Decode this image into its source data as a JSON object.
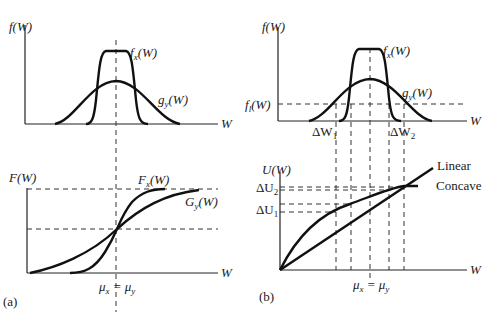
{
  "figure": {
    "panel_a": {
      "label": "(a)",
      "top": {
        "ylabel": "f(W)",
        "xlabel": "W",
        "curves": [
          {
            "name": "f_x(W)",
            "label": "f",
            "sub": "x",
            "suffix": "(W)",
            "shape": "narrow-tall"
          },
          {
            "name": "g_y(W)",
            "label": "g",
            "sub": "y",
            "suffix": "(W)",
            "shape": "wide-short"
          }
        ]
      },
      "bottom": {
        "ylabel": "F(W)",
        "xlabel": "W",
        "curves": [
          {
            "name": "F_x(W)",
            "label": "F",
            "sub": "x",
            "suffix": "(W)"
          },
          {
            "name": "G_y(W)",
            "label": "G",
            "sub": "y",
            "suffix": "(W)"
          }
        ],
        "mean_label": {
          "left": "μ",
          "left_sub": "x",
          "eq": " = ",
          "right": "μ",
          "right_sub": "y"
        }
      }
    },
    "panel_b": {
      "label": "(b)",
      "top": {
        "ylabel": "f(W)",
        "xlabel": "W",
        "threshold_label": {
          "main": "f",
          "sub": "l",
          "suffix": "(W)"
        },
        "curves": [
          {
            "name": "f_x(W)",
            "label": "f",
            "sub": "x",
            "suffix": "(W)"
          },
          {
            "name": "g_y(W)",
            "label": "g",
            "sub": "y",
            "suffix": "(W)"
          }
        ],
        "interval_labels": [
          {
            "main": "ΔW",
            "sub": "1"
          },
          {
            "main": "ΔW",
            "sub": "2"
          }
        ]
      },
      "bottom": {
        "ylabel": "U(W)",
        "xlabel": "W",
        "curves": [
          {
            "name": "Linear",
            "label": "Linear"
          },
          {
            "name": "Concave",
            "label": "Concave"
          }
        ],
        "utility_labels": [
          {
            "main": "ΔU",
            "sub": "2"
          },
          {
            "main": "ΔU",
            "sub": "1"
          }
        ],
        "mean_label": {
          "left": "μ",
          "left_sub": "x",
          "eq": " = ",
          "right": "μ",
          "right_sub": "y"
        }
      }
    }
  }
}
